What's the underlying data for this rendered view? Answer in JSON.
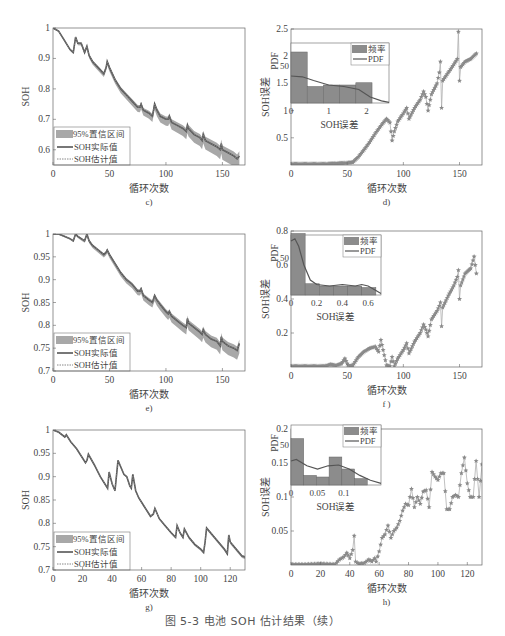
{
  "caption": "图 5-3   电池 SOH 估计结果（续）",
  "colors": {
    "actual": "#555555",
    "estimate": "#888888",
    "band": "#a8a8a8",
    "error_marker": "#8a8a8a",
    "bar": "#8c8c8c",
    "axis": "#666666"
  },
  "chart_data": [
    {
      "id": "c",
      "type": "line",
      "panel_label": "c)",
      "xlabel": "循环次数",
      "ylabel": "SOH",
      "xlim": [
        0,
        170
      ],
      "ylim": [
        0.55,
        1
      ],
      "xticks": [
        0,
        50,
        100,
        150
      ],
      "yticks": [
        0.6,
        0.7,
        0.8,
        0.9,
        1
      ],
      "ytick_labels": [
        "0.6",
        "0.7",
        "0.8",
        "0.9",
        "1"
      ],
      "legend": [
        "95%置信区间",
        "SOH实际值",
        "SOH估计值"
      ],
      "legend_position": "lower left",
      "series": [
        {
          "name": "SOH实际值",
          "x": [
            0,
            5,
            10,
            15,
            18,
            20,
            22,
            25,
            28,
            30,
            32,
            35,
            40,
            45,
            47,
            48,
            50,
            55,
            60,
            65,
            70,
            75,
            77,
            78,
            80,
            85,
            88,
            90,
            92,
            95,
            100,
            102,
            103,
            105,
            110,
            115,
            118,
            119,
            120,
            125,
            130,
            132,
            133,
            135,
            140,
            145,
            148,
            149,
            150,
            155,
            160,
            163,
            165
          ],
          "y": [
            1,
            0.99,
            0.96,
            0.93,
            0.92,
            0.97,
            0.95,
            0.95,
            0.92,
            0.94,
            0.91,
            0.89,
            0.87,
            0.85,
            0.87,
            0.89,
            0.87,
            0.83,
            0.8,
            0.78,
            0.76,
            0.74,
            0.74,
            0.75,
            0.73,
            0.72,
            0.71,
            0.75,
            0.73,
            0.71,
            0.7,
            0.7,
            0.71,
            0.69,
            0.68,
            0.67,
            0.66,
            0.68,
            0.67,
            0.65,
            0.64,
            0.63,
            0.65,
            0.63,
            0.62,
            0.61,
            0.6,
            0.62,
            0.6,
            0.59,
            0.58,
            0.57,
            0.58
          ]
        },
        {
          "name": "SOH估计值",
          "same_as": "SOH实际值"
        },
        {
          "name": "95%置信区间",
          "half_width_start": 0.002,
          "half_width_end": 0.025
        }
      ]
    },
    {
      "id": "d",
      "type": "scatter",
      "panel_label": "d)",
      "xlabel": "循环次数",
      "ylabel": "SOH误差",
      "xlim": [
        0,
        170
      ],
      "ylim": [
        0,
        2.5
      ],
      "xticks": [
        0,
        50,
        100,
        150
      ],
      "yticks": [
        0.5,
        1,
        1.5,
        2,
        2.5
      ],
      "ytick_labels": [
        "0.5",
        "1",
        "1.5",
        "2",
        "2.5"
      ],
      "series": [
        {
          "name": "SOH误差",
          "marker": "star",
          "x": [
            0,
            10,
            20,
            30,
            40,
            50,
            55,
            60,
            65,
            70,
            75,
            80,
            85,
            88,
            90,
            92,
            95,
            100,
            103,
            105,
            110,
            115,
            118,
            120,
            122,
            125,
            130,
            132,
            133,
            134,
            135,
            140,
            145,
            148,
            149,
            150,
            151,
            155,
            160,
            165
          ],
          "y": [
            0.02,
            0.02,
            0.02,
            0.02,
            0.03,
            0.04,
            0.05,
            0.15,
            0.28,
            0.42,
            0.58,
            0.72,
            0.85,
            0.78,
            0.45,
            0.62,
            0.8,
            0.95,
            1.05,
            0.85,
            1.05,
            1.2,
            1.35,
            1.25,
            1.0,
            1.3,
            1.5,
            1.7,
            1.9,
            1.05,
            1.55,
            1.7,
            1.85,
            1.95,
            2.45,
            1.55,
            1.8,
            1.9,
            1.95,
            2.05
          ]
        }
      ],
      "inset": {
        "type": "bar",
        "xlabel": "SOH误差",
        "ylabel": "PDF",
        "xlim": [
          0,
          2.6
        ],
        "ylim": [
          0,
          80
        ],
        "xticks": [
          0,
          1,
          2
        ],
        "yticks": [
          50
        ],
        "legend": [
          "频率",
          "PDF"
        ],
        "bins": [
          0,
          0.43,
          0.86,
          1.29,
          1.72,
          2.15
        ],
        "bin_width": 0.43,
        "values": [
          68,
          22,
          24,
          24,
          27
        ],
        "pdf_x": [
          0,
          0.3,
          0.6,
          1,
          1.4,
          1.8,
          2.1,
          2.4,
          2.6
        ],
        "pdf_y": [
          36,
          35,
          30,
          24,
          22,
          18,
          8,
          3,
          1
        ]
      }
    },
    {
      "id": "e",
      "type": "line",
      "panel_label": "e)",
      "xlabel": "循环次数",
      "ylabel": "SOH",
      "xlim": [
        0,
        170
      ],
      "ylim": [
        0.7,
        1
      ],
      "xticks": [
        0,
        50,
        100,
        150
      ],
      "yticks": [
        0.7,
        0.75,
        0.8,
        0.85,
        0.9,
        0.95,
        1
      ],
      "ytick_labels": [
        "0.7",
        "0.75",
        "0.8",
        "0.85",
        "0.9",
        "0.95",
        "1"
      ],
      "legend": [
        "95%置信区间",
        "SOH实际值",
        "SOH估计值"
      ],
      "legend_position": "lower left",
      "series": [
        {
          "name": "SOH实际值",
          "x": [
            0,
            5,
            10,
            15,
            18,
            20,
            22,
            25,
            28,
            30,
            32,
            35,
            40,
            45,
            47,
            48,
            50,
            55,
            60,
            65,
            70,
            75,
            77,
            78,
            80,
            85,
            88,
            90,
            92,
            95,
            100,
            102,
            103,
            105,
            110,
            115,
            118,
            119,
            120,
            125,
            130,
            132,
            133,
            135,
            140,
            145,
            148,
            149,
            150,
            155,
            160,
            163,
            165
          ],
          "y": [
            1,
            1,
            0.995,
            0.99,
            0.985,
            1,
            0.995,
            0.99,
            0.985,
            1,
            0.985,
            0.975,
            0.965,
            0.955,
            0.96,
            0.965,
            0.955,
            0.935,
            0.915,
            0.9,
            0.89,
            0.875,
            0.875,
            0.88,
            0.865,
            0.855,
            0.85,
            0.865,
            0.855,
            0.845,
            0.83,
            0.825,
            0.83,
            0.82,
            0.81,
            0.8,
            0.795,
            0.815,
            0.805,
            0.795,
            0.785,
            0.78,
            0.79,
            0.78,
            0.77,
            0.765,
            0.755,
            0.775,
            0.765,
            0.755,
            0.75,
            0.745,
            0.76
          ]
        },
        {
          "name": "SOH估计值",
          "same_as": "SOH实际值"
        },
        {
          "name": "95%置信区间",
          "half_width_start": 0.001,
          "half_width_end": 0.015
        }
      ]
    },
    {
      "id": "f",
      "type": "scatter",
      "panel_label": "f )",
      "xlabel": "循环次数",
      "ylabel": "SOH误差",
      "xlim": [
        0,
        170
      ],
      "ylim": [
        0,
        0.8
      ],
      "xticks": [
        0,
        50,
        100,
        150
      ],
      "yticks": [
        0.2,
        0.4,
        0.6,
        0.8
      ],
      "ytick_labels": [
        "0.2",
        "0.4",
        "0.6",
        "0.8"
      ],
      "series": [
        {
          "name": "SOH误差",
          "marker": "star",
          "x": [
            0,
            10,
            20,
            30,
            35,
            40,
            45,
            48,
            50,
            52,
            55,
            60,
            65,
            70,
            75,
            78,
            80,
            85,
            88,
            90,
            92,
            95,
            100,
            103,
            105,
            110,
            115,
            118,
            120,
            122,
            125,
            130,
            132,
            133,
            134,
            135,
            140,
            145,
            148,
            149,
            150,
            151,
            155,
            160,
            163,
            165
          ],
          "y": [
            0.005,
            0.005,
            0.005,
            0.005,
            0.015,
            0.01,
            0.02,
            0.05,
            0.02,
            0.005,
            0.01,
            0.06,
            0.09,
            0.11,
            0.12,
            0.09,
            0.16,
            0.01,
            0.005,
            0.06,
            0.005,
            0.05,
            0.1,
            0.14,
            0.08,
            0.15,
            0.2,
            0.25,
            0.22,
            0.18,
            0.28,
            0.33,
            0.36,
            0.38,
            0.24,
            0.35,
            0.42,
            0.48,
            0.53,
            0.57,
            0.4,
            0.48,
            0.55,
            0.58,
            0.65,
            0.55
          ]
        }
      ],
      "inset": {
        "type": "bar",
        "xlabel": "SOH误差",
        "ylabel": "PDF",
        "xlim": [
          0,
          0.7
        ],
        "ylim": [
          0,
          80
        ],
        "xticks": [
          0,
          0.2,
          0.4,
          0.6
        ],
        "yticks": [
          50
        ],
        "legend": [
          "频率",
          "PDF"
        ],
        "bins": [
          0,
          0.11,
          0.22,
          0.33,
          0.44,
          0.55
        ],
        "bin_width": 0.11,
        "values": [
          82,
          15,
          12,
          12,
          12,
          10
        ],
        "pdf_x": [
          0,
          0.03,
          0.06,
          0.1,
          0.15,
          0.2,
          0.3,
          0.4,
          0.5,
          0.55,
          0.6,
          0.66,
          0.7
        ],
        "pdf_y": [
          72,
          75,
          65,
          40,
          20,
          14,
          12,
          14,
          12,
          14,
          12,
          6,
          2
        ]
      }
    },
    {
      "id": "g",
      "type": "line",
      "panel_label": "g)",
      "xlabel": "循环次数",
      "ylabel": "SOH",
      "xlim": [
        0,
        130
      ],
      "ylim": [
        0.7,
        1
      ],
      "xticks": [
        0,
        20,
        40,
        60,
        80,
        100,
        120
      ],
      "yticks": [
        0.7,
        0.75,
        0.8,
        0.85,
        0.9,
        0.95,
        1
      ],
      "ytick_labels": [
        "0.7",
        "0.75",
        "0.8",
        "0.85",
        "0.9",
        "0.95",
        "1"
      ],
      "legend": [
        "95%置信区间",
        "SOH实际值",
        "SOH估计值"
      ],
      "legend_position": "lower left",
      "series": [
        {
          "name": "SOH实际值",
          "x": [
            0,
            4,
            8,
            9,
            12,
            16,
            20,
            22,
            23,
            24,
            28,
            32,
            36,
            37,
            38,
            40,
            42,
            44,
            46,
            48,
            50,
            52,
            53,
            54,
            56,
            58,
            62,
            66,
            68,
            69,
            72,
            76,
            80,
            83,
            84,
            86,
            88,
            89,
            92,
            96,
            100,
            102,
            103,
            104,
            108,
            112,
            116,
            118,
            119,
            120,
            124,
            128,
            130
          ],
          "y": [
            1,
            0.995,
            0.985,
            0.99,
            0.975,
            0.96,
            0.94,
            0.93,
            0.935,
            0.948,
            0.925,
            0.9,
            0.88,
            0.875,
            0.91,
            0.885,
            0.87,
            0.935,
            0.92,
            0.905,
            0.9,
            0.88,
            0.875,
            0.905,
            0.87,
            0.855,
            0.835,
            0.815,
            0.82,
            0.832,
            0.81,
            0.795,
            0.78,
            0.77,
            0.795,
            0.78,
            0.77,
            0.788,
            0.77,
            0.755,
            0.745,
            0.738,
            0.76,
            0.79,
            0.775,
            0.76,
            0.745,
            0.735,
            0.775,
            0.76,
            0.745,
            0.73,
            0.728
          ]
        },
        {
          "name": "SOH估计值",
          "same_as": "SOH实际值"
        },
        {
          "name": "95%置信区间",
          "half_width_start": 0.001,
          "half_width_end": 0.003
        }
      ]
    },
    {
      "id": "h",
      "type": "scatter",
      "panel_label": "h)",
      "xlabel": "循环次数",
      "ylabel": "SOH误差",
      "xlim": [
        0,
        130
      ],
      "ylim": [
        0,
        0.2
      ],
      "xticks": [
        0,
        20,
        40,
        60,
        80,
        100,
        120
      ],
      "yticks": [
        0.05,
        0.1,
        0.15,
        0.2
      ],
      "ytick_labels": [
        "0.05",
        "0.1",
        "0.15",
        "0.2"
      ],
      "series": [
        {
          "name": "SOH误差",
          "marker": "star",
          "x": [
            0,
            10,
            20,
            30,
            33,
            36,
            38,
            40,
            42,
            43,
            44,
            46,
            50,
            53,
            55,
            57,
            58,
            60,
            62,
            64,
            66,
            68,
            70,
            72,
            74,
            76,
            78,
            80,
            82,
            84,
            86,
            88,
            90,
            92,
            94,
            96,
            98,
            100,
            102,
            104,
            106,
            108,
            110,
            112,
            114,
            116,
            118,
            120,
            122,
            124,
            126,
            128,
            130
          ],
          "y": [
            0.001,
            0.001,
            0.002,
            0.001,
            0.008,
            0.012,
            0.018,
            0.01,
            0.022,
            0.043,
            0.005,
            0.002,
            0.003,
            0.008,
            0.005,
            0.01,
            0.005,
            0.02,
            0.04,
            0.045,
            0.058,
            0.04,
            0.05,
            0.055,
            0.065,
            0.08,
            0.09,
            0.088,
            0.112,
            0.085,
            0.1,
            0.09,
            0.108,
            0.11,
            0.085,
            0.137,
            0.13,
            0.125,
            0.135,
            0.135,
            0.082,
            0.082,
            0.1,
            0.103,
            0.1,
            0.135,
            0.158,
            0.12,
            0.1,
            0.1,
            0.153,
            0.1,
            0.148
          ]
        }
      ],
      "inset": {
        "type": "bar",
        "xlabel": "SOH误差",
        "ylabel": "PDF",
        "xlim": [
          0,
          0.17
        ],
        "ylim": [
          0,
          75
        ],
        "xticks": [
          0,
          0.05,
          0.1
        ],
        "yticks": [
          50
        ],
        "legend": [
          "频率",
          "PDF"
        ],
        "bins": [
          0,
          0.024,
          0.048,
          0.072,
          0.096,
          0.12
        ],
        "bin_width": 0.024,
        "values": [
          58,
          12,
          10,
          35,
          20,
          8
        ],
        "pdf_x": [
          0,
          0.01,
          0.03,
          0.05,
          0.07,
          0.09,
          0.11,
          0.13,
          0.15,
          0.17
        ],
        "pdf_y": [
          30,
          32,
          24,
          20,
          24,
          25,
          20,
          12,
          6,
          2
        ]
      }
    }
  ]
}
